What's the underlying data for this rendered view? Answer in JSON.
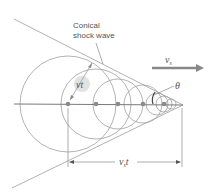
{
  "diagram": {
    "title_label_line1": "Conical",
    "title_label_line2": "shock wave",
    "source_velocity_label": "v",
    "source_velocity_sub": "s",
    "wave_radius_label": "vt",
    "angle_label": "θ",
    "distance_label": "v",
    "distance_sub": "s",
    "distance_suffix": "t",
    "colors": {
      "line": "#9a9a9a",
      "axis": "#777777",
      "dot": "#888888",
      "arrow": "#888888",
      "highlight": "#e2e2e2",
      "text": "#555555"
    }
  }
}
